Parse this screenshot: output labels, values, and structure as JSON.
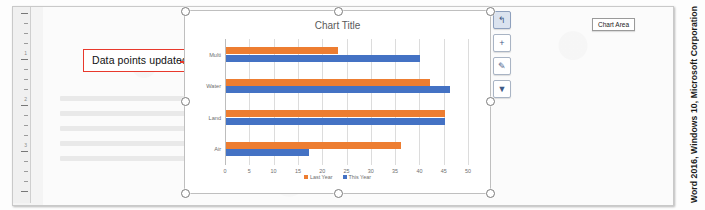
{
  "document": {
    "app_caption": "Word 2016, Windows 10, Microsoft Corporation",
    "ruler_numbers": [
      "1",
      "2",
      "3"
    ]
  },
  "annotation": {
    "callout_text": "Data points updated",
    "border_color": "#E8392C"
  },
  "chart": {
    "title": "Chart Title",
    "tooltip_label": "Chart Area",
    "selected": true,
    "side_buttons": [
      {
        "name": "layout-options-button",
        "glyph": "↰",
        "active": true
      },
      {
        "name": "chart-elements-button",
        "glyph": "+",
        "active": false
      },
      {
        "name": "chart-styles-button",
        "glyph": "✎",
        "active": false
      },
      {
        "name": "chart-filters-button",
        "glyph": "▼",
        "active": false
      }
    ]
  },
  "chart_data": {
    "type": "bar",
    "orientation": "horizontal",
    "title": "Chart Title",
    "xlabel": "",
    "ylabel": "",
    "xlim": [
      0,
      50
    ],
    "xticks": [
      0,
      5,
      10,
      15,
      20,
      25,
      30,
      35,
      40,
      45,
      50
    ],
    "tick_labels": [
      "0",
      "5",
      "10",
      "15",
      "20",
      "25",
      "30",
      "35",
      "40",
      "45",
      "50"
    ],
    "categories": [
      "Multi",
      "Water",
      "Land",
      "Air"
    ],
    "grid": true,
    "legend_position": "bottom",
    "series": [
      {
        "name": "Last Year",
        "color": "#ED7D31",
        "values": [
          23,
          42,
          45,
          36
        ]
      },
      {
        "name": "This Year",
        "color": "#4472C4",
        "values": [
          40,
          46,
          45,
          17
        ]
      }
    ]
  }
}
